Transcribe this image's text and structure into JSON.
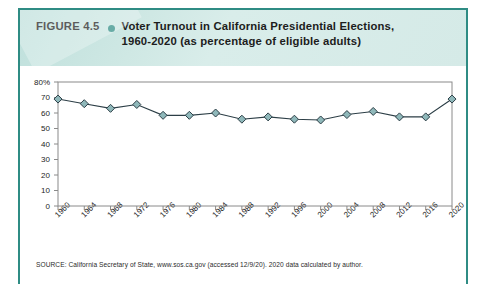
{
  "figure": {
    "label": "FIGURE 4.5",
    "bullet_icon": "bullet-dot-icon",
    "title_line1": "Voter Turnout in California Presidential Elections,",
    "title_line2": "1960-2020 (as percentage of eligible adults)",
    "source": "SOURCE: California Secretary of State, www.sos.ca.gov (accessed 12/9/20). 2020 data calculated by author."
  },
  "colors": {
    "accent_teal": "#2f8c84",
    "header_bg": "#cfe8e4",
    "marker_fill": "#8fb8ba",
    "marker_stroke": "#2c3e46",
    "line": "#2c3e46",
    "axis": "#8a8a8a",
    "text": "#1d1d1d"
  },
  "chart_data": {
    "type": "line",
    "title": "Voter Turnout in California Presidential Elections, 1960-2020 (as percentage of eligible adults)",
    "xlabel": "",
    "ylabel": "",
    "ylim": [
      0,
      80
    ],
    "ytick_values": [
      80,
      70,
      60,
      50,
      40,
      30,
      20,
      10,
      0
    ],
    "ytick_labels": [
      "80%",
      "70",
      "60",
      "50",
      "40",
      "30",
      "20",
      "10",
      "0"
    ],
    "grid": false,
    "legend": "none",
    "marker": "diamond",
    "categories": [
      "1960",
      "1964",
      "1968",
      "1972",
      "1976",
      "1980",
      "1984",
      "1988",
      "1992",
      "1996",
      "2000",
      "2004",
      "2008",
      "2012",
      "2016",
      "2020"
    ],
    "values": [
      69.0,
      66.0,
      63.0,
      65.5,
      58.5,
      58.5,
      60.0,
      56.0,
      57.5,
      56.0,
      55.5,
      59.0,
      61.0,
      57.5,
      57.5,
      69.0
    ]
  }
}
